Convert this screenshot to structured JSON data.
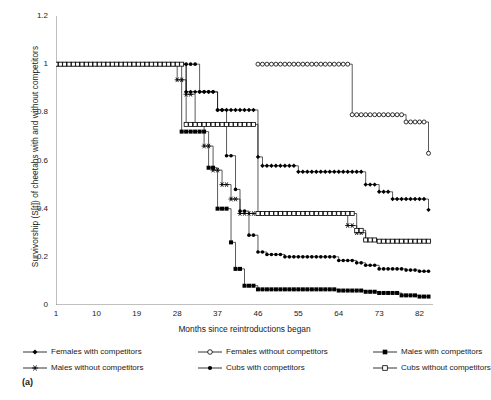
{
  "figure": {
    "panel_label": "(a)",
    "axis_color": "#808080",
    "series_color": "#000000"
  },
  "chart_data": {
    "type": "line",
    "subtype": "kaplan-meier-step",
    "title": "",
    "xlabel": "Months since reintroductions began",
    "ylabel": "Survivorship (S[t]) of cheetahs with and without competitors",
    "xlim": [
      1,
      85
    ],
    "ylim": [
      0,
      1.2
    ],
    "xticks": [
      1,
      10,
      19,
      28,
      37,
      46,
      55,
      64,
      73,
      82
    ],
    "xticklabels": [
      "1",
      "10",
      "19",
      "28",
      "37",
      "46",
      "55",
      "64",
      "73",
      "82"
    ],
    "yticks": [
      0,
      0.2,
      0.4,
      0.6,
      0.8,
      1,
      1.2
    ],
    "yticklabels": [
      "0",
      "0.2",
      "0.4",
      "0.6",
      "0.8",
      "1",
      "1.2"
    ],
    "grid": false,
    "legend_position": "below",
    "series": [
      {
        "name": "Females with competitors",
        "marker": "filled-diamond",
        "x": [
          1,
          29,
          30,
          31,
          32,
          33,
          36,
          37,
          41,
          43,
          46,
          47,
          55,
          64,
          66,
          68,
          70,
          73,
          76,
          79,
          82,
          84
        ],
        "y": [
          1,
          1,
          0.885,
          0.885,
          0.885,
          0.885,
          0.885,
          0.81,
          0.81,
          0.81,
          0.615,
          0.578,
          0.553,
          0.553,
          0.553,
          0.553,
          0.5,
          0.47,
          0.44,
          0.44,
          0.44,
          0.395
        ]
      },
      {
        "name": "Females without competitors",
        "marker": "open-circle",
        "x": [
          46,
          48,
          52,
          56,
          60,
          64,
          66,
          67,
          69,
          72,
          76,
          79,
          82,
          84
        ],
        "y": [
          1,
          1,
          1,
          1,
          1,
          1,
          1,
          0.79,
          0.79,
          0.79,
          0.79,
          0.76,
          0.76,
          0.63
        ]
      },
      {
        "name": "Males with competitors",
        "marker": "filled-square",
        "x": [
          1,
          28,
          29,
          31,
          33,
          35,
          37,
          38,
          40,
          41,
          43,
          46,
          52,
          58,
          64,
          70,
          73,
          78,
          82,
          84
        ],
        "y": [
          1,
          1,
          0.72,
          0.72,
          0.72,
          0.57,
          0.4,
          0.4,
          0.26,
          0.15,
          0.08,
          0.065,
          0.065,
          0.065,
          0.06,
          0.055,
          0.05,
          0.04,
          0.035,
          0.035
        ]
      },
      {
        "name": "Males without competitors",
        "marker": "star",
        "x": [
          1,
          27,
          28,
          30,
          32,
          34,
          36,
          38,
          40,
          42,
          44,
          46,
          55,
          64,
          66,
          68,
          70,
          73,
          78,
          82,
          84
        ],
        "y": [
          1,
          1,
          0.935,
          0.875,
          0.75,
          0.66,
          0.56,
          0.5,
          0.44,
          0.38,
          0.38,
          0.38,
          0.38,
          0.38,
          0.33,
          0.3,
          0.27,
          0.265,
          0.265,
          0.265,
          0.265
        ]
      },
      {
        "name": "Cubs with competitors",
        "marker": "filled-dot",
        "x": [
          1,
          30,
          31,
          33,
          35,
          37,
          39,
          41,
          42,
          44,
          46,
          48,
          52,
          55,
          60,
          64,
          68,
          70,
          73,
          76,
          79,
          82,
          84
        ],
        "y": [
          1,
          1,
          1,
          0.885,
          0.885,
          0.81,
          0.62,
          0.48,
          0.39,
          0.29,
          0.22,
          0.21,
          0.2,
          0.2,
          0.2,
          0.185,
          0.175,
          0.165,
          0.15,
          0.15,
          0.145,
          0.14,
          0.14
        ]
      },
      {
        "name": "Cubs without competitors",
        "marker": "open-square",
        "x": [
          1,
          29,
          30,
          33,
          36,
          39,
          41,
          43,
          46,
          55,
          64,
          66,
          68,
          70,
          73,
          78,
          82,
          84
        ],
        "y": [
          1,
          1,
          0.75,
          0.75,
          0.75,
          0.75,
          0.75,
          0.75,
          0.38,
          0.38,
          0.38,
          0.38,
          0.31,
          0.27,
          0.265,
          0.265,
          0.265,
          0.265
        ]
      }
    ]
  },
  "legend": {
    "items": [
      {
        "label": "Females with competitors",
        "marker": "filled-diamond"
      },
      {
        "label": "Females without competitors",
        "marker": "open-circle"
      },
      {
        "label": "Males with competitors",
        "marker": "filled-square"
      },
      {
        "label": "Males without competitors",
        "marker": "star"
      },
      {
        "label": "Cubs with competitors",
        "marker": "filled-dot"
      },
      {
        "label": "Cubs without competitors",
        "marker": "open-square"
      }
    ]
  }
}
